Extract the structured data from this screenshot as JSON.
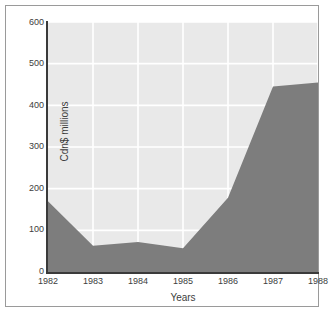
{
  "chart_data": {
    "type": "area",
    "title": "",
    "xlabel": "Years",
    "ylabel": "Cdn$ millions",
    "categories": [
      "1982",
      "1983",
      "1984",
      "1985",
      "1986",
      "1987",
      "1988"
    ],
    "values": [
      170,
      63,
      72,
      57,
      178,
      445,
      455
    ],
    "series": [
      {
        "name": "Cdn$ millions",
        "values": [
          170,
          63,
          72,
          57,
          178,
          445,
          455
        ]
      }
    ],
    "xlim": [
      1982,
      1988
    ],
    "ylim": [
      0,
      600
    ],
    "yticks": [
      0,
      100,
      200,
      300,
      400,
      500,
      600
    ],
    "ytick_labels": [
      "0",
      "100",
      "200",
      "300",
      "400",
      "500",
      "600"
    ],
    "xtick_labels": [
      "1982",
      "1983",
      "1984",
      "1985",
      "1986",
      "1987",
      "1988"
    ],
    "grid": true,
    "legend": "none",
    "colors": {
      "area_fill": "#7d7d7d",
      "plot_background": "#e9e9e9",
      "gridline": "#ffffff",
      "axis_line": "#3a3a3a",
      "text": "#3d3d3d",
      "frame_border": "#9a9a9a",
      "page_background": "#ffffff"
    }
  }
}
